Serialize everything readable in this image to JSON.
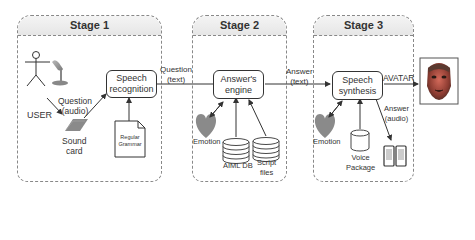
{
  "stages": [
    {
      "title": "Stage 1"
    },
    {
      "title": "Stage 2"
    },
    {
      "title": "Stage 3"
    }
  ],
  "stage1": {
    "user_label": "USER",
    "question_audio": [
      "Question",
      "(audio)"
    ],
    "sound_card": [
      "Sound",
      "card"
    ],
    "speech_recognition": [
      "Speech",
      "recognition"
    ],
    "regular_grammar": [
      "Regular",
      "Grammar"
    ]
  },
  "question_text": [
    "Question",
    "(text)"
  ],
  "stage2": {
    "answers_engine": [
      "Answer's",
      "engine"
    ],
    "emotion": "Emotion",
    "aiml_db": "AIML DB",
    "script_files": [
      "Script",
      "files"
    ]
  },
  "answer_text": [
    "Answer",
    "(text)"
  ],
  "stage3": {
    "speech_synthesis": [
      "Speech",
      "synthesis"
    ],
    "emotion": "Emotion",
    "voice_package": [
      "Voice",
      "Package"
    ],
    "answer_audio": [
      "Answer",
      "(audio)"
    ]
  },
  "avatar_label": "AVATAR",
  "colors": {
    "heart": "#8a8a8a",
    "line": "#333333",
    "dashed_border": "#888888"
  }
}
